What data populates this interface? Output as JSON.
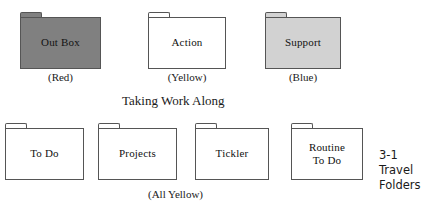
{
  "figure": {
    "section_title": "Taking Work Along",
    "caption_number": "3-1",
    "caption_line2": "Travel",
    "caption_line3": "Folders",
    "caption_full": "3-1\nTravel\nFolders"
  },
  "row_one": {
    "folders": [
      {
        "label": "Out Box",
        "color_caption": "(Red)",
        "fill_hex": "#808080",
        "fill_style": "dark"
      },
      {
        "label": "Action",
        "color_caption": "(Yellow)",
        "fill_hex": "#ffffff",
        "fill_style": "white"
      },
      {
        "label": "Support",
        "color_caption": "(Blue)",
        "fill_hex": "#d2d2d2",
        "fill_style": "light"
      }
    ]
  },
  "row_two": {
    "group_caption": "(All Yellow)",
    "folders": [
      {
        "label": "To Do",
        "fill_hex": "#ffffff",
        "fill_style": "white"
      },
      {
        "label": "Projects",
        "fill_hex": "#ffffff",
        "fill_style": "white"
      },
      {
        "label": "Tickler",
        "fill_hex": "#ffffff",
        "fill_style": "white"
      },
      {
        "label": "Routine\nTo Do",
        "fill_hex": "#ffffff",
        "fill_style": "white"
      }
    ]
  },
  "colors": {
    "outline": "#555555",
    "text": "#1a1a1a",
    "background": "#ffffff"
  }
}
